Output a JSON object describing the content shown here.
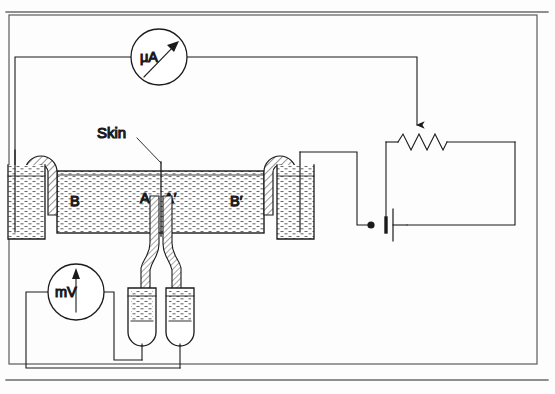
{
  "figure": {
    "type": "schematic-diagram",
    "background_color": "#fdfdfd",
    "line_color": "#1b1b1b",
    "frame": {
      "name": "outer-border",
      "stroke": "#5a5a5a"
    }
  },
  "labels": {
    "skin": "Skin",
    "chamber_left": "B",
    "membrane_left": "A",
    "membrane_right": "A′",
    "chamber_right": "B′",
    "microammeter": "μA",
    "millivoltmeter": "mV"
  },
  "components": [
    {
      "name": "microammeter",
      "label": "μA",
      "kind": "meter",
      "needle": "up-right"
    },
    {
      "name": "millivoltmeter",
      "label": "mV",
      "kind": "meter",
      "needle": "up"
    },
    {
      "name": "rheostat",
      "label": "",
      "kind": "variable-resistor",
      "symbol": "zigzag-with-wiper-arrow"
    },
    {
      "name": "battery",
      "label": "",
      "kind": "cell",
      "symbol": "single-cell"
    },
    {
      "name": "chamber",
      "label": "",
      "kind": "fluid-chamber",
      "fill": "stippled-liquid"
    },
    {
      "name": "left-agar-bridge",
      "label": "",
      "kind": "salt-bridge"
    },
    {
      "name": "right-agar-bridge",
      "label": "",
      "kind": "salt-bridge"
    },
    {
      "name": "left-electrode-beaker",
      "label": "",
      "kind": "beaker"
    },
    {
      "name": "right-electrode-beaker",
      "label": "",
      "kind": "beaker"
    },
    {
      "name": "left-calomel-electrode",
      "label": "",
      "kind": "reference-electrode"
    },
    {
      "name": "right-calomel-electrode",
      "label": "",
      "kind": "reference-electrode"
    }
  ],
  "colors": {
    "ink": "#1b1b1b",
    "frame": "#5a5a5a",
    "hatch": "#3a3a3a",
    "liquid": "#6d6d6d",
    "paper": "#fdfdfd"
  }
}
